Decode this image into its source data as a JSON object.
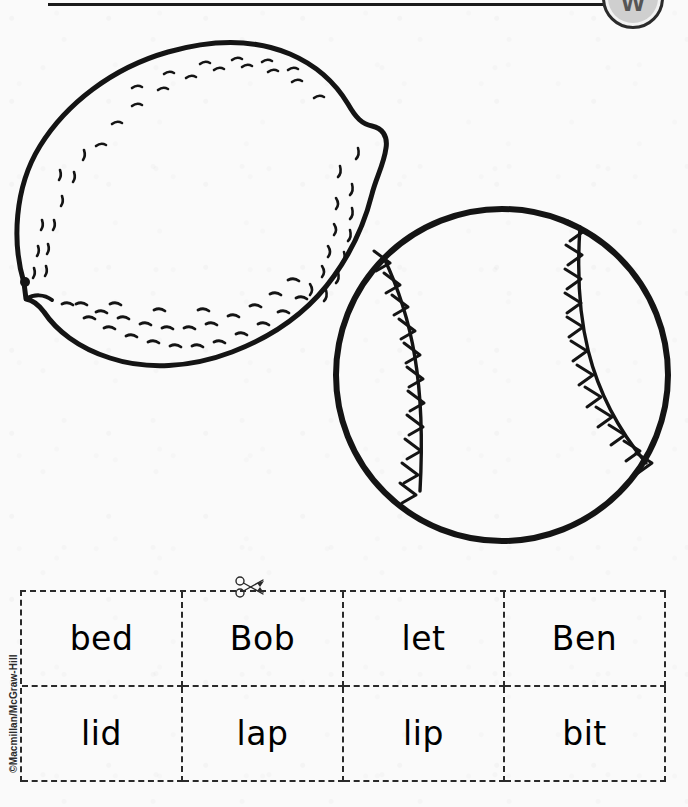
{
  "page": {
    "width": 688,
    "height": 807,
    "background_color": "#fafafa",
    "ink_color": "#1a1a1a"
  },
  "header": {
    "rule_label": "header-rule",
    "badge": {
      "icon": "circular-badge-icon",
      "glyph": "W"
    }
  },
  "illustrations": [
    {
      "name": "lemon",
      "label": "lemon",
      "description": "black and white line drawing of a lemon with stippled rind texture"
    },
    {
      "name": "baseball",
      "label": "baseball",
      "description": "black and white line drawing of a baseball with two curved stitched seams"
    }
  ],
  "cut_line": {
    "icon": "scissors-icon",
    "label": "cut along dashed line"
  },
  "word_table": {
    "columns": 4,
    "rows": [
      [
        "bed",
        "Bob",
        "let",
        "Ben"
      ],
      [
        "lid",
        "lap",
        "lip",
        "bit"
      ]
    ]
  },
  "footer": {
    "copyright": "©Macmillan/McGraw-Hill"
  }
}
